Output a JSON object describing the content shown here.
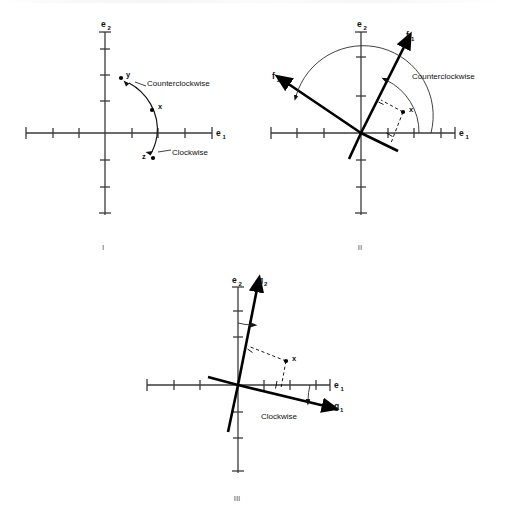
{
  "figure": {
    "width": 505,
    "height": 517,
    "background": "#ffffff",
    "ink_color": "#111111",
    "axis_color": "#3a3a3a"
  },
  "panels": [
    {
      "id": "I",
      "caption": "I",
      "caption_pos": {
        "x": 105,
        "y": 249
      },
      "origin": {
        "x": 105,
        "y": 133
      },
      "axes": {
        "x_label": "e",
        "x_sub": "1",
        "y_label": "e",
        "y_sub": "2",
        "x_min": 26,
        "x_max": 212,
        "y_min": 32,
        "y_max": 215,
        "tick_spacing": 26.5,
        "x_ticks": [
          26,
          53,
          79,
          132,
          158,
          185,
          212
        ],
        "y_ticks": [
          49,
          75,
          101,
          160,
          187,
          213
        ]
      },
      "points": [
        {
          "name": "y",
          "label": "y",
          "x": 124,
          "y": 78,
          "label_dx": 6,
          "label_dy": 1
        },
        {
          "name": "x",
          "label": "x",
          "x": 155,
          "y": 108,
          "label_dx": 7,
          "label_dy": 0
        },
        {
          "name": "z",
          "label": "z",
          "x": 152,
          "y": 157,
          "label_dx": -11,
          "label_dy": 1
        }
      ],
      "annotations": [
        {
          "name": "counterclockwise-label",
          "text": "Counterclockwise",
          "x": 146,
          "y": 86
        },
        {
          "name": "clockwise-label",
          "text": "Clockwise",
          "x": 172,
          "y": 154
        }
      ]
    },
    {
      "id": "II",
      "caption": "II",
      "caption_pos": {
        "x": 361,
        "y": 249
      },
      "origin": {
        "x": 361,
        "y": 133
      },
      "axes": {
        "x_label": "e",
        "x_sub": "1",
        "y_label": "e",
        "y_sub": "2",
        "x_min": 271,
        "x_max": 455,
        "y_min": 32,
        "y_max": 215,
        "tick_spacing": 26.5,
        "x_ticks": [
          271,
          297,
          324,
          388,
          414,
          441
        ],
        "y_ticks": [
          49,
          75,
          101,
          160,
          187,
          213
        ]
      },
      "vectors": [
        {
          "name": "f1",
          "label": "f",
          "sub": "1",
          "tip": {
            "x": 406,
            "y": 40
          },
          "label_pos": {
            "x": 410,
            "y": 34
          },
          "angle_deg": 65
        },
        {
          "name": "f2",
          "label": "f",
          "sub": "2",
          "tip": {
            "x": 283,
            "y": 81
          },
          "label_pos": {
            "x": 276,
            "y": 79
          },
          "angle_deg": 155
        }
      ],
      "points": [
        {
          "name": "x",
          "label": "x",
          "x": 404,
          "y": 112,
          "label_dx": 7,
          "label_dy": 1
        }
      ],
      "annotations": [
        {
          "name": "counterclockwise-label",
          "text": "Counterclockwise",
          "x": 412,
          "y": 77
        }
      ],
      "arcs": [
        {
          "name": "frame-rotation-arc",
          "from_deg": 0,
          "to_deg": 155,
          "radius": 70
        },
        {
          "name": "component-arc",
          "from_deg": 0,
          "to_deg": 65,
          "radius": 58
        }
      ]
    },
    {
      "id": "III",
      "caption": "III",
      "caption_pos": {
        "x": 238,
        "y": 500
      },
      "origin": {
        "x": 238,
        "y": 385
      },
      "axes": {
        "x_label": "e",
        "x_sub": "1",
        "y_label": "e",
        "y_sub": "2",
        "x_min": 147,
        "x_max": 330,
        "y_min": 287,
        "y_max": 473,
        "tick_spacing": 26.5,
        "x_ticks": [
          147,
          174,
          200,
          264,
          290,
          316
        ],
        "y_ticks": [
          303,
          330,
          356,
          412,
          438,
          464
        ]
      },
      "vectors": [
        {
          "name": "g1",
          "label": "g",
          "sub": "1",
          "tip": {
            "x": 330,
            "y": 406
          },
          "label_pos": {
            "x": 337,
            "y": 407
          },
          "angle_deg": -14
        },
        {
          "name": "g2",
          "label": "g",
          "sub": "2",
          "tip": {
            "x": 259,
            "y": 283
          },
          "label_pos": {
            "x": 261,
            "y": 281
          },
          "angle_deg": 76
        }
      ],
      "points": [
        {
          "name": "x",
          "label": "x",
          "x": 289,
          "y": 360,
          "label_dx": 7,
          "label_dy": 1
        }
      ],
      "annotations": [
        {
          "name": "clockwise-label",
          "text": "Clockwise",
          "x": 261,
          "y": 416
        }
      ],
      "arcs": [
        {
          "name": "e1-to-g1-arc",
          "from_deg": 0,
          "to_deg": -14,
          "radius": 72
        },
        {
          "name": "e2-to-g2-arc",
          "from_deg": 90,
          "to_deg": 76,
          "radius": 62
        }
      ]
    }
  ],
  "labels": {
    "counterclockwise": "Counterclockwise",
    "clockwise": "Clockwise",
    "point_x": "x",
    "point_y": "y",
    "point_z": "z",
    "e1": "e",
    "e1_sub": "1",
    "e2": "e",
    "e2_sub": "2",
    "f1": "f",
    "f1_sub": "1",
    "f2": "f",
    "f2_sub": "2",
    "g1": "g",
    "g1_sub": "1",
    "g2": "g",
    "g2_sub": "2",
    "roman_1": "I",
    "roman_2": "II",
    "roman_3": "III"
  }
}
